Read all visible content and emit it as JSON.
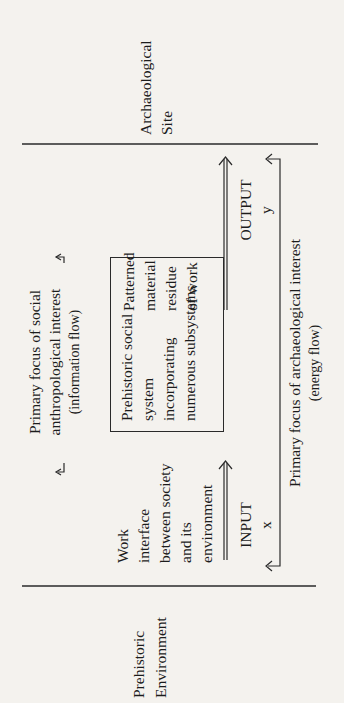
{
  "diagram": {
    "left_region": {
      "label_lines": [
        "Prehistoric",
        "Environment"
      ]
    },
    "right_region": {
      "label_lines": [
        "Archaeological",
        "Site"
      ]
    },
    "info_flow": {
      "label_lines": [
        "Primary focus of social",
        "anthropological interest"
      ],
      "sublabel": "(information flow)"
    },
    "central_box": {
      "label_lines": [
        "Prehistoric social",
        "system",
        "incorporating",
        "numerous subsystems"
      ]
    },
    "work_interface": {
      "label_lines": [
        "Work",
        "interface",
        "between society",
        "and its",
        "environment"
      ]
    },
    "residue": {
      "label_lines": [
        "Patterned",
        "material",
        "residue",
        "of work"
      ]
    },
    "input": {
      "label": "INPUT",
      "variable": "x"
    },
    "output": {
      "label": "OUTPUT",
      "variable": "y"
    },
    "energy_flow": {
      "label": "Primary focus of archaeological interest",
      "sublabel": "(energy flow)"
    }
  }
}
